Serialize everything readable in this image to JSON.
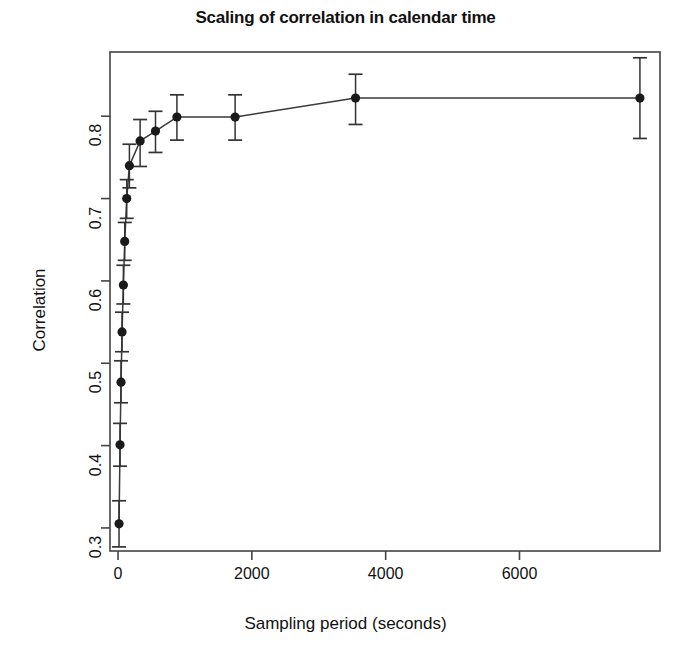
{
  "chart_data": {
    "type": "scatter",
    "title": "Scaling of correlation in calendar time",
    "xlabel": "Sampling period (seconds)",
    "ylabel": "Correlation",
    "xlim": [
      -120,
      8100
    ],
    "ylim": [
      0.272,
      0.878
    ],
    "xticks": [
      0,
      2000,
      4000,
      6000
    ],
    "xticklabels": [
      "0",
      "2000",
      "4000",
      "6000"
    ],
    "yticks": [
      0.3,
      0.4,
      0.5,
      0.6,
      0.7,
      0.8
    ],
    "yticklabels": [
      "0.3",
      "0.4",
      "0.5",
      "0.6",
      "0.7",
      "0.8"
    ],
    "grid": false,
    "legend": null,
    "line_style": "solid-connecting",
    "marker": "filled-circle",
    "error_bars": "vertical",
    "series": [
      {
        "name": "Correlation vs sampling period",
        "x": [
          15,
          30,
          60,
          90,
          120,
          160,
          200,
          250,
          300,
          420,
          560,
          880,
          1750,
          3550,
          7800
        ],
        "y": [
          0.305,
          0.401,
          0.477,
          0.538,
          0.595,
          0.648,
          0.7,
          0.74,
          0.77,
          0.782,
          0.799,
          0.82,
          0.822,
          0.822,
          0.822
        ],
        "y_err_low": [
          0.277,
          0.375,
          0.452,
          0.514,
          0.572,
          0.625,
          0.676,
          0.713,
          0.739,
          0.756,
          0.771,
          0.79,
          0.79,
          0.773,
          0.773
        ],
        "y_err_high": [
          0.333,
          0.427,
          0.503,
          0.562,
          0.619,
          0.671,
          0.723,
          0.766,
          0.796,
          0.806,
          0.826,
          0.851,
          0.851,
          0.871,
          0.871
        ]
      }
    ],
    "points_plotted": [
      {
        "x": 15,
        "y": 0.305,
        "lo": 0.277,
        "hi": 0.333
      },
      {
        "x": 30,
        "y": 0.401,
        "lo": 0.375,
        "hi": 0.427
      },
      {
        "x": 45,
        "y": 0.477,
        "lo": 0.452,
        "hi": 0.503
      },
      {
        "x": 60,
        "y": 0.538,
        "lo": 0.514,
        "hi": 0.562
      },
      {
        "x": 80,
        "y": 0.595,
        "lo": 0.572,
        "hi": 0.619
      },
      {
        "x": 100,
        "y": 0.648,
        "lo": 0.625,
        "hi": 0.671
      },
      {
        "x": 130,
        "y": 0.7,
        "lo": 0.676,
        "hi": 0.723
      },
      {
        "x": 170,
        "y": 0.74,
        "lo": 0.713,
        "hi": 0.766
      },
      {
        "x": 330,
        "y": 0.77,
        "lo": 0.739,
        "hi": 0.796
      },
      {
        "x": 560,
        "y": 0.782,
        "lo": 0.756,
        "hi": 0.806
      },
      {
        "x": 880,
        "y": 0.799,
        "lo": 0.771,
        "hi": 0.826
      },
      {
        "x": 1750,
        "y": 0.799,
        "lo": 0.771,
        "hi": 0.826
      },
      {
        "x": 3550,
        "y": 0.822,
        "lo": 0.79,
        "hi": 0.851
      },
      {
        "x": 7800,
        "y": 0.822,
        "lo": 0.773,
        "hi": 0.871
      }
    ],
    "colors": {
      "marker": "#1a1a1a",
      "line": "#3a3a3a",
      "error_bar": "#333333",
      "axis": "#444444",
      "text": "#111111",
      "background": "#ffffff"
    }
  }
}
